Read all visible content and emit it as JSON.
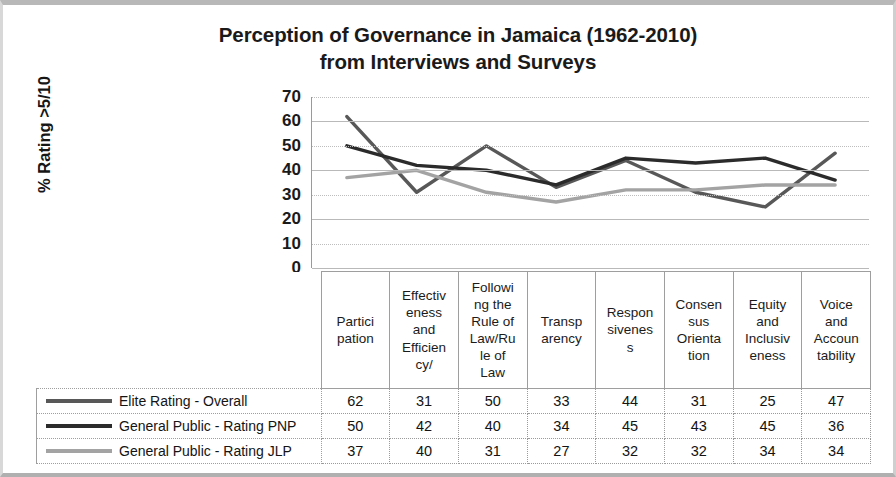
{
  "chart_data": {
    "type": "line",
    "title": "Perception of Governance in Jamaica (1962-2010) from Interviews and Surveys",
    "title_line1": "Perception of Governance in Jamaica (1962-2010)",
    "title_line2": "from Interviews and Surveys",
    "xlabel": "",
    "ylabel": "% Rating >5/10",
    "ylim": [
      0,
      70
    ],
    "ytick_step": 10,
    "yticks": [
      70,
      60,
      50,
      40,
      30,
      20,
      10,
      0
    ],
    "grid": true,
    "legend_position": "data-table-left",
    "has_data_table": true,
    "categories": [
      "Partici pation",
      "Effectiv eness and Efficien cy/",
      "Followi ng the Rule of Law/Ru le of Law",
      "Transp arency",
      "Respon sivenes s",
      "Consen sus Orienta tion",
      "Equity and Inclusiv eness",
      "Voice and Accoun tability"
    ],
    "category_lines": [
      [
        "Partici",
        "pation"
      ],
      [
        "Effectiv",
        "eness",
        "and",
        "Efficien",
        "cy/"
      ],
      [
        "Followi",
        "ng the",
        "Rule of",
        "Law/Ru",
        "le of",
        "Law"
      ],
      [
        "Transp",
        "arency"
      ],
      [
        "Respon",
        "sivenes",
        "s"
      ],
      [
        "Consen",
        "sus",
        "Orienta",
        "tion"
      ],
      [
        "Equity",
        "and",
        "Inclusiv",
        "eness"
      ],
      [
        "Voice",
        "and",
        "Accoun",
        "tability"
      ]
    ],
    "series": [
      {
        "name": "Elite Rating - Overall",
        "color": "#585858",
        "values": [
          62,
          31,
          50,
          33,
          44,
          31,
          25,
          47
        ]
      },
      {
        "name": "General Public - Rating PNP",
        "color": "#2b2b2b",
        "values": [
          50,
          42,
          40,
          34,
          45,
          43,
          45,
          36
        ]
      },
      {
        "name": "General Public - Rating JLP",
        "color": "#a3a3a3",
        "values": [
          37,
          40,
          31,
          27,
          32,
          32,
          34,
          34
        ]
      }
    ]
  },
  "colors": {
    "frame": "#b8b8b8",
    "gridline": "#c9c9c9",
    "text": "#1a1a1a",
    "table_border": "#9e9e9e"
  }
}
